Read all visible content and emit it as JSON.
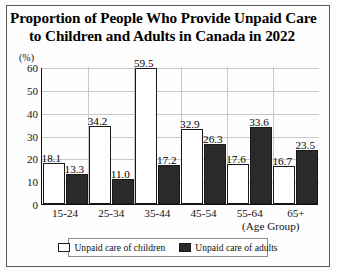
{
  "chart_data": {
    "type": "bar",
    "title": "Proportion of People Who Provide Unpaid Care to Children and Adults in Canada in 2022",
    "title_lines": [
      "Proportion of People Who Provide Unpaid Care",
      "to Children and Adults in Canada in 2022"
    ],
    "xlabel": "(Age Group)",
    "ylabel": "(%)",
    "ylim": [
      0,
      60
    ],
    "yticks": [
      0,
      10,
      20,
      30,
      40,
      50,
      60
    ],
    "ytick_labels": [
      "0",
      "10",
      "20",
      "30",
      "40",
      "50",
      "60"
    ],
    "grid": true,
    "legend_position": "bottom",
    "categories": [
      "15-24",
      "25-34",
      "35-44",
      "45-54",
      "55-64",
      "65+"
    ],
    "series": [
      {
        "name": "Unpaid care of children",
        "color": "#ffffff",
        "values": [
          18.1,
          34.2,
          59.5,
          32.9,
          17.6,
          16.7
        ],
        "value_labels": [
          "18.1",
          "34.2",
          "59.5",
          "32.9",
          "17.6",
          "16.7"
        ]
      },
      {
        "name": "Unpaid care of adults",
        "color": "#2a2a2a",
        "values": [
          13.3,
          11.0,
          17.2,
          26.3,
          33.6,
          23.5
        ],
        "value_labels": [
          "13.3",
          "11.0",
          "17.2",
          "26.3",
          "33.6",
          "23.5"
        ]
      }
    ]
  }
}
